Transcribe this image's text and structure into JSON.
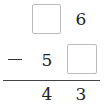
{
  "problem": {
    "operation": "subtraction",
    "operator_symbol": "−",
    "row1": {
      "tens": {
        "type": "blank",
        "value": ""
      },
      "ones": {
        "type": "digit",
        "value": "6"
      }
    },
    "row2": {
      "tens": {
        "type": "digit",
        "value": "5"
      },
      "ones": {
        "type": "blank",
        "value": ""
      }
    },
    "result": {
      "tens": {
        "type": "digit",
        "value": "4"
      },
      "ones": {
        "type": "digit",
        "value": "3"
      }
    }
  },
  "colors": {
    "box_border": "#bdbdbd",
    "text": "#222222",
    "rule": "#444444",
    "background": "#ffffff"
  }
}
